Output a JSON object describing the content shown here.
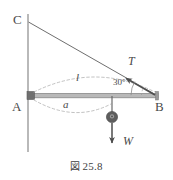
{
  "figure": {
    "caption_mark": "図",
    "caption_number": "25.8",
    "caption_full": "図 25.8"
  },
  "labels": {
    "wall_top_point": "C",
    "pivot_point": "A",
    "beam_end_point": "B",
    "tension_force": "T",
    "weight_force": "W",
    "beam_length": "l",
    "weight_distance": "a",
    "cable_angle": "30°"
  },
  "colors": {
    "line": "#7a7a7a",
    "cable": "#6e6e6e",
    "beam": "#9a9a9a",
    "beam_edge": "#6f6f6f",
    "wall": "#a8a8a8",
    "dashed": "#b0b0b0",
    "text": "#4a4a4a",
    "weight_fill": "#5e5e5e",
    "arrow": "#4d4d4d",
    "background": "#ffffff"
  },
  "geometry": {
    "wall_x": 28,
    "wall_top_y": 14,
    "wall_bottom_y": 152,
    "point_C": [
      28,
      22
    ],
    "point_A": [
      30,
      96
    ],
    "point_B": [
      158,
      96
    ],
    "weight_x": 112,
    "weight_y": 117,
    "tension_arrow_tip": [
      123,
      79
    ],
    "weight_arrow_tip": [
      112,
      146
    ],
    "angle_degrees": 30
  }
}
